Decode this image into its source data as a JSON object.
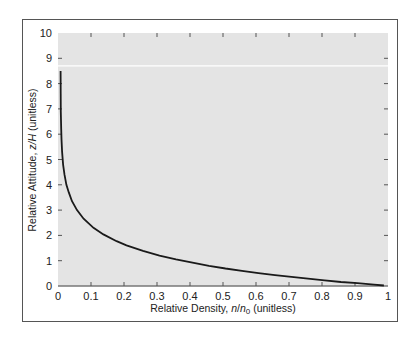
{
  "chart_data": {
    "type": "line",
    "title": "",
    "xlabel": "Relative Density, n/n0 (unitless)",
    "xlabel_parts": {
      "prefix": "Relative Density, ",
      "n": "n",
      "slash": "/",
      "n0": "n",
      "sub": "0",
      "suffix": " (unitless)"
    },
    "ylabel": "Relative Attitude, z/H (unitless)",
    "ylabel_parts": {
      "prefix": "Relative Attitude, ",
      "var": "z/H",
      "suffix": " (unitless)"
    },
    "xlim": [
      0,
      1
    ],
    "ylim": [
      0,
      10
    ],
    "x_ticks": [
      "0",
      "0.1",
      "0.2",
      "0.3",
      "0.4",
      "0.5",
      "0.6",
      "0.7",
      "0.8",
      "0.9",
      "1"
    ],
    "y_ticks": [
      "0",
      "1",
      "2",
      "3",
      "4",
      "5",
      "6",
      "7",
      "8",
      "9",
      "10"
    ],
    "grid": false,
    "legend": null,
    "reference_line": {
      "y": 8.7,
      "color": "#ffffff"
    },
    "series": [
      {
        "name": "z/H = -ln(n/n0)",
        "color": "#1a1a1a",
        "x": [
          0.0002,
          0.0005,
          0.001,
          0.002,
          0.003,
          0.005,
          0.008,
          0.012,
          0.018,
          0.025,
          0.035,
          0.05,
          0.07,
          0.1,
          0.13,
          0.17,
          0.2,
          0.25,
          0.3,
          0.35,
          0.4,
          0.45,
          0.5,
          0.55,
          0.6,
          0.65,
          0.7,
          0.75,
          0.8,
          0.85,
          0.9,
          0.95,
          0.98
        ],
        "y": [
          8.5,
          7.6,
          6.9,
          6.2,
          5.8,
          5.3,
          4.8,
          4.4,
          4.0,
          3.7,
          3.35,
          3.0,
          2.66,
          2.3,
          2.04,
          1.77,
          1.61,
          1.39,
          1.2,
          1.05,
          0.92,
          0.8,
          0.69,
          0.6,
          0.51,
          0.43,
          0.36,
          0.29,
          0.22,
          0.16,
          0.11,
          0.05,
          0.02
        ]
      }
    ]
  },
  "colors": {
    "plot_background": "#e4e4e4",
    "curve": "#1a1a1a",
    "frame": "#555555"
  }
}
